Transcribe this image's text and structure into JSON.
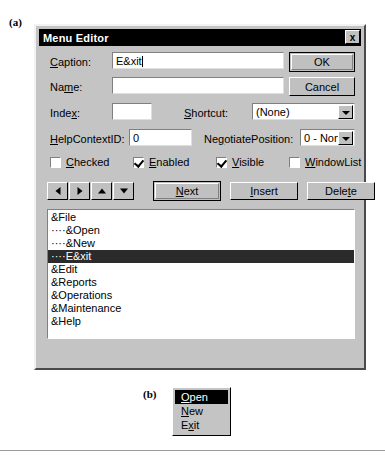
{
  "figure": {
    "label_a": "(a)",
    "label_b": "(b)"
  },
  "dialog": {
    "title": "Menu Editor",
    "close_icon": "×",
    "close_label": "x",
    "fields": {
      "caption_label": "Caption:",
      "caption_value": "E&xit",
      "name_label": "Name:",
      "name_value": "",
      "index_label": "Index:",
      "index_value": "",
      "shortcut_label": "Shortcut:",
      "shortcut_value": "(None)",
      "helpcontextid_label": "HelpContextID:",
      "helpcontextid_value": "0",
      "negotiateposition_label": "NegotiatePosition:",
      "negotiateposition_value": "0 - None"
    },
    "checkboxes": [
      {
        "label": "Checked",
        "checked": false
      },
      {
        "label": "Enabled",
        "checked": true
      },
      {
        "label": "Visible",
        "checked": true
      },
      {
        "label": "WindowList",
        "checked": false
      }
    ],
    "buttons": {
      "ok": "OK",
      "cancel": "Cancel",
      "next": "Next",
      "insert": "Insert",
      "delete": "Delete"
    },
    "arrow_buttons": [
      {
        "name": "move-left",
        "glyph": "←"
      },
      {
        "name": "move-right",
        "glyph": "→"
      },
      {
        "name": "move-up",
        "glyph": "↑"
      },
      {
        "name": "move-down",
        "glyph": "↓"
      }
    ],
    "menu_list": [
      {
        "text": "&File",
        "selected": false
      },
      {
        "text": "····&Open",
        "selected": false
      },
      {
        "text": "····&New",
        "selected": false
      },
      {
        "text": "····E&xit",
        "selected": true
      },
      {
        "text": "&Edit",
        "selected": false
      },
      {
        "text": "&Reports",
        "selected": false
      },
      {
        "text": "&Operations",
        "selected": false
      },
      {
        "text": "&Maintenance",
        "selected": false
      },
      {
        "text": "&Help",
        "selected": false
      }
    ]
  },
  "popup_menu": {
    "items": [
      {
        "text": "Open",
        "accel": "O",
        "selected": true
      },
      {
        "text": "New",
        "accel": "N",
        "selected": false
      },
      {
        "text": "Exit",
        "accel": "x",
        "selected": false
      }
    ]
  },
  "colors": {
    "dialog_face": "#c4c4c4",
    "titlebar": "#000000",
    "selection": "#2b2b2b",
    "field_bg": "#ffffff"
  }
}
